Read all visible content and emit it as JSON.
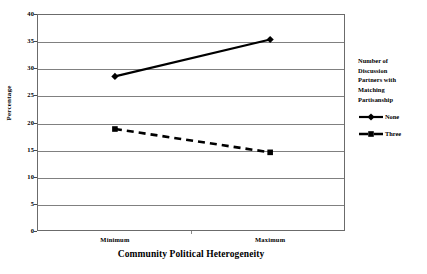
{
  "chart_data": {
    "type": "line",
    "title": "",
    "xlabel": "Community Political Heterogeneity",
    "ylabel": "Percentage",
    "categories": [
      "Minimum",
      "Maximum"
    ],
    "series": [
      {
        "name": "None",
        "values": [
          28.5,
          35.3
        ],
        "marker": "diamond",
        "line_style": "solid",
        "color": "#000000"
      },
      {
        "name": "Three",
        "values": [
          18.8,
          14.5
        ],
        "marker": "square",
        "line_style": "dashed",
        "color": "#000000"
      }
    ],
    "ylim": [
      0,
      40
    ],
    "ytick_values": [
      0,
      5,
      10,
      15,
      20,
      25,
      30,
      35,
      40
    ],
    "ytick_labels": [
      "0",
      "5",
      "10",
      "15",
      "20",
      "25",
      "30",
      "35",
      "40"
    ],
    "grid": true,
    "grid_axis": "y",
    "legend_position": "right",
    "legend_title": "Number of Discussion Partners with Matching Partisanship"
  },
  "legend": {
    "title_lines": [
      "Number of",
      "Discussion",
      "Partners with",
      "Matching",
      "Partisanship"
    ],
    "entries": [
      {
        "label": "None"
      },
      {
        "label": "Three"
      }
    ]
  },
  "colors": {
    "axis": "#6b6b6b",
    "gridline": "#808080",
    "series": "#000000",
    "background": "#ffffff"
  }
}
